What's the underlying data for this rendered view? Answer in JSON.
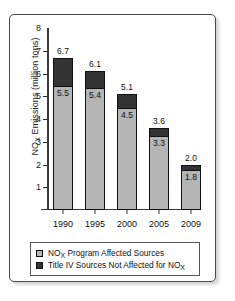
{
  "chart_data": {
    "type": "bar",
    "subtype": "stacked-vertical",
    "title": "",
    "xlabel": "",
    "ylabel": "NOX Emissions (million tons)",
    "ylabel_parts": {
      "pre": "NO",
      "sub": "X",
      "post": " Emissions (million tons)"
    },
    "categories": [
      "1990",
      "1995",
      "2000",
      "2005",
      "2009"
    ],
    "ylim": [
      0,
      8
    ],
    "yticks": [
      1,
      2,
      3,
      4,
      5,
      6,
      7,
      8
    ],
    "ytick_labels": [
      "1",
      "2",
      "3",
      "4",
      "5",
      "6",
      "7",
      "8"
    ],
    "grid": false,
    "legend_position": "bottom",
    "series": [
      {
        "name": "NOX Program Affected Sources",
        "name_parts": {
          "pre": "NO",
          "sub": "X",
          "post": " Program Affected Sources"
        },
        "color": "#b4b4b4",
        "values": [
          5.5,
          5.4,
          4.5,
          3.3,
          1.8
        ],
        "value_labels": [
          "5.5",
          "5.4",
          "4.5",
          "3.3",
          "1.8"
        ]
      },
      {
        "name": "Title IV Sources Not Affected for NOX",
        "name_parts": {
          "pre": "Title IV Sources Not Affected for NO",
          "sub": "X",
          "post": ""
        },
        "color": "#333333",
        "values": [
          1.2,
          0.7,
          0.6,
          0.3,
          0.2
        ],
        "value_labels": [
          "1.2",
          "0.7",
          "0.6",
          "0.3",
          "0.2"
        ]
      }
    ],
    "totals": [
      6.7,
      6.1,
      5.1,
      3.6,
      2.0
    ],
    "total_labels": [
      "6.7",
      "6.1",
      "5.1",
      "3.6",
      "2.0"
    ]
  },
  "legend": {
    "items": [
      {
        "swatch_color": "#b4b4b4",
        "label_pre": "NO",
        "label_sub": "X",
        "label_post": " Program Affected Sources"
      },
      {
        "swatch_color": "#333333",
        "label_pre": "Title IV Sources Not Affected for NO",
        "label_sub": "X",
        "label_post": ""
      }
    ]
  },
  "colors": {
    "light_series": "#b4b4b4",
    "dark_series": "#333333",
    "axis": "#3a3a3a",
    "frame": "#4a4a4a",
    "text": "#111111",
    "background": "#ffffff"
  }
}
